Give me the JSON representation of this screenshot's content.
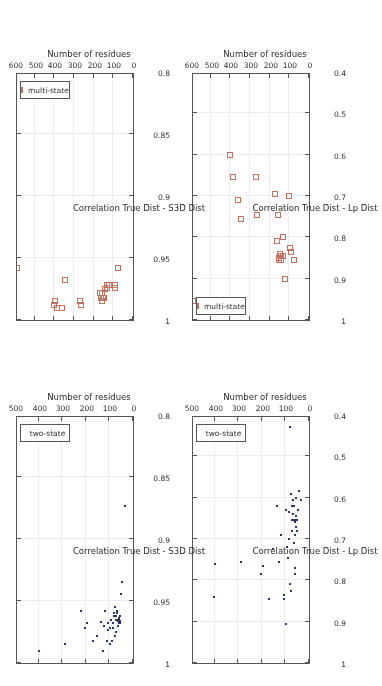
{
  "figure": {
    "orientation_deg": 180,
    "panel_count": 4,
    "colors": {
      "two_state": "#2b3566",
      "multi_state": "#c4705c",
      "axis": "#555555",
      "grid": "#ededed",
      "text": "#2b2b2b",
      "background": "#ffffff"
    }
  },
  "chart_data": [
    {
      "id": "panel-top-left",
      "type": "scatter",
      "title": "",
      "xlabel": "Number of residues",
      "ylabel": "Correlation True Dist - Lp Dist",
      "xlim": [
        0,
        500
      ],
      "ylim": [
        0.4,
        1.0
      ],
      "xticks": [
        0,
        100,
        200,
        300,
        400,
        500
      ],
      "xticklabels": [
        "0",
        "100",
        "200",
        "300",
        "400",
        "500"
      ],
      "yticks": [
        0.4,
        0.5,
        0.6,
        0.7,
        0.8,
        0.9,
        1.0
      ],
      "yticklabels": [
        "0.4",
        "0.5",
        "0.6",
        "0.7",
        "0.8",
        "0.9",
        "1"
      ],
      "grid": true,
      "legend": {
        "position": "lower-right",
        "entries": [
          "two-state"
        ]
      },
      "series": [
        {
          "name": "two-state",
          "marker": "dot",
          "color": "#2b3566",
          "points": [
            [
              36,
              0.605
            ],
            [
              42,
              0.585
            ],
            [
              48,
              0.63
            ],
            [
              50,
              0.655
            ],
            [
              52,
              0.68
            ],
            [
              54,
              0.655
            ],
            [
              55,
              0.6
            ],
            [
              56,
              0.67
            ],
            [
              57,
              0.645
            ],
            [
              58,
              0.77
            ],
            [
              59,
              0.785
            ],
            [
              60,
              0.66
            ],
            [
              61,
              0.69
            ],
            [
              62,
              0.62
            ],
            [
              63,
              0.655
            ],
            [
              64,
              0.71
            ],
            [
              66,
              0.64
            ],
            [
              68,
              0.605
            ],
            [
              70,
              0.62
            ],
            [
              72,
              0.68
            ],
            [
              74,
              0.655
            ],
            [
              76,
              0.825
            ],
            [
              78,
              0.59
            ],
            [
              80,
              0.81
            ],
            [
              82,
              0.43
            ],
            [
              84,
              0.635
            ],
            [
              86,
              0.7
            ],
            [
              88,
              0.745
            ],
            [
              92,
              0.72
            ],
            [
              96,
              0.905
            ],
            [
              98,
              0.63
            ],
            [
              104,
              0.835
            ],
            [
              108,
              0.845
            ],
            [
              118,
              0.69
            ],
            [
              128,
              0.755
            ],
            [
              134,
              0.62
            ],
            [
              152,
              0.725
            ],
            [
              168,
              0.845
            ],
            [
              196,
              0.765
            ],
            [
              205,
              0.785
            ],
            [
              288,
              0.755
            ],
            [
              398,
              0.76
            ],
            [
              402,
              0.84
            ]
          ]
        }
      ]
    },
    {
      "id": "panel-top-right",
      "type": "scatter",
      "title": "",
      "xlabel": "Number of residues",
      "ylabel": "Correlation True Dist - S3D Dist",
      "xlim": [
        0,
        500
      ],
      "ylim": [
        0.8,
        1.0
      ],
      "xticks": [
        0,
        100,
        200,
        300,
        400,
        500
      ],
      "xticklabels": [
        "0",
        "100",
        "200",
        "300",
        "400",
        "500"
      ],
      "yticks": [
        0.8,
        0.85,
        0.9,
        0.95,
        1.0
      ],
      "yticklabels": [
        "0.8",
        "0.85",
        "0.9",
        "0.95",
        "1"
      ],
      "grid": true,
      "legend": {
        "position": "lower-right",
        "entries": [
          "two-state"
        ]
      },
      "series": [
        {
          "name": "two-state",
          "marker": "dot",
          "color": "#2b3566",
          "points": [
            [
              36,
              0.873
            ],
            [
              48,
              0.935
            ],
            [
              52,
              0.944
            ],
            [
              54,
              0.962
            ],
            [
              56,
              0.966
            ],
            [
              57,
              0.968
            ],
            [
              58,
              0.966
            ],
            [
              59,
              0.964
            ],
            [
              60,
              0.968
            ],
            [
              61,
              0.965
            ],
            [
              62,
              0.97
            ],
            [
              63,
              0.966
            ],
            [
              64,
              0.965
            ],
            [
              66,
              0.958
            ],
            [
              68,
              0.96
            ],
            [
              70,
              0.975
            ],
            [
              72,
              0.965
            ],
            [
              74,
              0.962
            ],
            [
              76,
              0.978
            ],
            [
              78,
              0.955
            ],
            [
              80,
              0.962
            ],
            [
              82,
              0.96
            ],
            [
              84,
              0.972
            ],
            [
              86,
              0.968
            ],
            [
              88,
              0.982
            ],
            [
              92,
              0.965
            ],
            [
              96,
              0.985
            ],
            [
              98,
              0.972
            ],
            [
              104,
              0.968
            ],
            [
              108,
              0.973
            ],
            [
              112,
              0.982
            ],
            [
              118,
              0.958
            ],
            [
              124,
              0.97
            ],
            [
              128,
              0.99
            ],
            [
              134,
              0.967
            ],
            [
              152,
              0.978
            ],
            [
              168,
              0.982
            ],
            [
              196,
              0.968
            ],
            [
              205,
              0.972
            ],
            [
              222,
              0.958
            ],
            [
              288,
              0.985
            ],
            [
              398,
              0.99
            ]
          ]
        }
      ]
    },
    {
      "id": "panel-bottom-left",
      "type": "scatter",
      "title": "",
      "xlabel": "Number of residues",
      "ylabel": "Correlation True Dist - Lp Dist",
      "xlim": [
        0,
        600
      ],
      "ylim": [
        0.4,
        1.0
      ],
      "xticks": [
        0,
        100,
        200,
        300,
        400,
        500,
        600
      ],
      "xticklabels": [
        "0",
        "100",
        "200",
        "300",
        "400",
        "500",
        "600"
      ],
      "yticks": [
        0.4,
        0.5,
        0.6,
        0.7,
        0.8,
        0.9,
        1.0
      ],
      "yticklabels": [
        "0.4",
        "0.5",
        "0.6",
        "0.7",
        "0.8",
        "0.9",
        "1"
      ],
      "grid": true,
      "legend": {
        "position": "upper-right",
        "entries": [
          "multi-state"
        ]
      },
      "series": [
        {
          "name": "multi-state",
          "marker": "square",
          "color": "#c4705c",
          "points": [
            [
              78,
              0.855
            ],
            [
              92,
              0.835
            ],
            [
              98,
              0.825
            ],
            [
              100,
              0.7
            ],
            [
              122,
              0.9
            ],
            [
              130,
              0.845
            ],
            [
              134,
              0.8
            ],
            [
              140,
              0.855
            ],
            [
              142,
              0.845
            ],
            [
              145,
              0.84
            ],
            [
              150,
              0.855
            ],
            [
              152,
              0.85
            ],
            [
              158,
              0.745
            ],
            [
              162,
              0.81
            ],
            [
              172,
              0.695
            ],
            [
              262,
              0.745
            ],
            [
              272,
              0.655
            ],
            [
              348,
              0.755
            ],
            [
              362,
              0.71
            ],
            [
              388,
              0.655
            ],
            [
              402,
              0.6
            ],
            [
              592,
              0.955
            ]
          ]
        }
      ]
    },
    {
      "id": "panel-bottom-right",
      "type": "scatter",
      "title": "",
      "xlabel": "Number of residues",
      "ylabel": "Correlation True Dist - S3D Dist",
      "xlim": [
        0,
        600
      ],
      "ylim": [
        0.8,
        1.0
      ],
      "xticks": [
        0,
        100,
        200,
        300,
        400,
        500,
        600
      ],
      "xticklabels": [
        "0",
        "100",
        "200",
        "300",
        "400",
        "500",
        "600"
      ],
      "yticks": [
        0.8,
        0.85,
        0.9,
        0.95,
        1.0
      ],
      "yticklabels": [
        "0.8",
        "0.85",
        "0.9",
        "0.95",
        "1"
      ],
      "grid": true,
      "legend": {
        "position": "lower-right",
        "entries": [
          "multi-state"
        ]
      },
      "series": [
        {
          "name": "multi-state",
          "marker": "square",
          "color": "#c4705c",
          "points": [
            [
              78,
              0.958
            ],
            [
              90,
              0.972
            ],
            [
              92,
              0.974
            ],
            [
              94,
              0.972
            ],
            [
              124,
              0.972
            ],
            [
              130,
              0.974
            ],
            [
              134,
              0.972
            ],
            [
              142,
              0.975
            ],
            [
              148,
              0.982
            ],
            [
              152,
              0.982
            ],
            [
              156,
              0.978
            ],
            [
              160,
              0.985
            ],
            [
              162,
              0.982
            ],
            [
              168,
              0.978
            ],
            [
              266,
              0.988
            ],
            [
              270,
              0.985
            ],
            [
              348,
              0.968
            ],
            [
              362,
              0.99
            ],
            [
              388,
              0.99
            ],
            [
              398,
              0.985
            ],
            [
              404,
              0.988
            ],
            [
              590,
              0.958
            ]
          ]
        }
      ]
    }
  ],
  "axis_titles": {
    "x": "Number of residues",
    "y_lp": "Correlation True Dist - Lp Dist",
    "y_s3d": "Correlation True Dist - S3D Dist"
  },
  "legend_labels": {
    "two_state": "two-state",
    "multi_state": "multi-state"
  }
}
